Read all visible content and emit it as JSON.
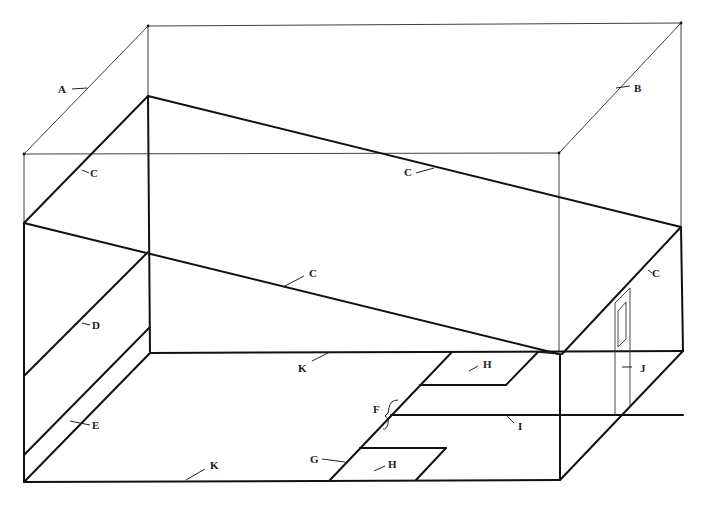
{
  "diagram": {
    "labels": {
      "A": "A",
      "B": "B",
      "C1": "C",
      "C2": "C",
      "C3": "C",
      "C4": "C",
      "D": "D",
      "E": "E",
      "F": "F",
      "G": "G",
      "H1": "H",
      "H2": "H",
      "I": "I",
      "J": "J",
      "K1": "K",
      "K2": "K"
    },
    "colors": {
      "background": "#ffffff",
      "line": "#111111"
    }
  }
}
